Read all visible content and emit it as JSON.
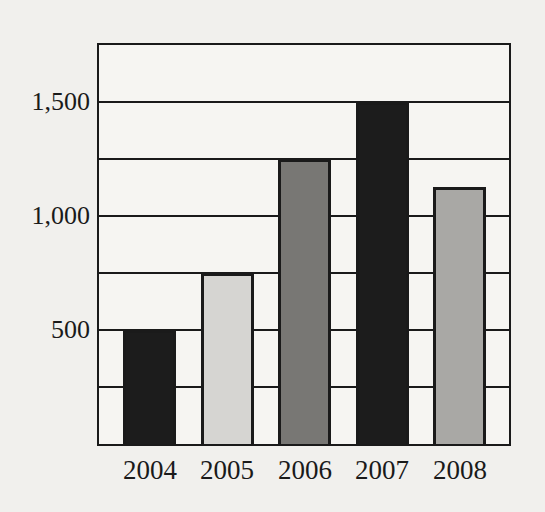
{
  "chart_data": {
    "type": "bar",
    "title": "",
    "xlabel": "",
    "ylabel": "",
    "categories": [
      "2004",
      "2005",
      "2006",
      "2007",
      "2008"
    ],
    "values": [
      500,
      750,
      1250,
      1500,
      1125
    ],
    "bar_colors": [
      "#1c1c1c",
      "#d6d5d2",
      "#787774",
      "#1c1c1c",
      "#a9a8a5"
    ],
    "ylim": [
      0,
      1750
    ],
    "gridline_interval": 250,
    "y_ticks": [
      {
        "value": 500,
        "label": "500"
      },
      {
        "value": 1000,
        "label": "1,000"
      },
      {
        "value": 1500,
        "label": "1,500"
      }
    ],
    "grid": "horizontal-on",
    "legend": "none"
  },
  "colors": {
    "page_bg": "#f1f0ed",
    "plot_bg": "#f6f5f2",
    "line": "#1a1a1a",
    "text": "#1a1a1a"
  }
}
